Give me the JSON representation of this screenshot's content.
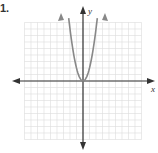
{
  "problem": {
    "number": "1."
  },
  "axes": {
    "x_label": "x",
    "y_label": "y"
  },
  "chart_data": {
    "type": "line",
    "title": "",
    "xlabel": "x",
    "ylabel": "y",
    "grid": true,
    "xlim": [
      -9,
      9
    ],
    "ylim": [
      -9,
      9
    ],
    "series": [
      {
        "name": "parabola",
        "function": "y = a*x^2 (a≈2)",
        "vertex": [
          0,
          0
        ],
        "x": [
          -2.4,
          -2,
          -1.5,
          -1,
          -0.5,
          0,
          0.5,
          1,
          1.5,
          2,
          2.4
        ],
        "values": [
          11.5,
          8,
          4.5,
          2,
          0.5,
          0,
          0.5,
          2,
          4.5,
          8,
          11.5
        ]
      }
    ],
    "colors": {
      "curve": "#888888",
      "axis": "#333333",
      "grid": "#dddddd"
    }
  }
}
